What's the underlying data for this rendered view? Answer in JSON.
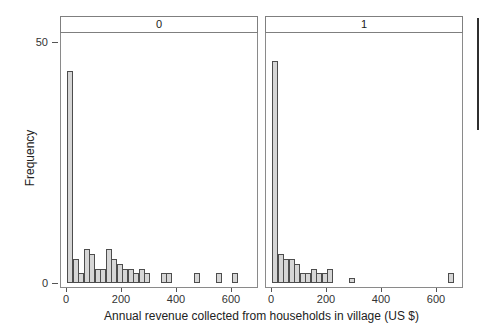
{
  "labels": {
    "y_tick_top": "50",
    "y_tick_bottom": "0"
  },
  "chart_data": {
    "type": "histogram",
    "layout": "two-facet trellis histogram, facets side by side with strip labels on top",
    "xlabel": "Annual revenue collected from households in village (US $)",
    "ylabel": "Frequency",
    "bin_width": 20,
    "x_ticks": [
      0,
      200,
      400,
      600
    ],
    "y_ticks": [
      0,
      50
    ],
    "xlim": [
      0,
      690
    ],
    "ylim": [
      0,
      52
    ],
    "grid": "off",
    "bar_fill": "#d6d6d6",
    "bar_stroke": "#4d4d4d",
    "facets": [
      {
        "label": "0",
        "bin_start": 0,
        "frequencies": [
          44,
          5,
          2,
          7,
          6,
          3,
          3,
          7,
          5,
          4,
          3,
          3,
          2,
          3,
          2,
          0,
          0,
          2,
          2,
          0,
          0,
          0,
          0,
          2,
          0,
          0,
          0,
          2,
          0,
          0,
          2
        ]
      },
      {
        "label": "1",
        "bin_start": 0,
        "frequencies": [
          46,
          6,
          5,
          5,
          4,
          2,
          2,
          3,
          2,
          2,
          3,
          0,
          0,
          0,
          1,
          0,
          0,
          0,
          0,
          0,
          0,
          0,
          0,
          0,
          0,
          0,
          0,
          0,
          0,
          0,
          0,
          0,
          2
        ]
      }
    ]
  }
}
